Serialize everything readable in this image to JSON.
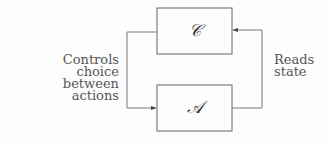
{
  "nodes": {
    "controller": {
      "label": "𝒞"
    },
    "agent": {
      "label": "𝒜"
    }
  },
  "edges": {
    "left": {
      "label_line1": "Controls choice",
      "label_line2": "between actions"
    },
    "right": {
      "label_line1": "Reads",
      "label_line2": "state"
    }
  }
}
